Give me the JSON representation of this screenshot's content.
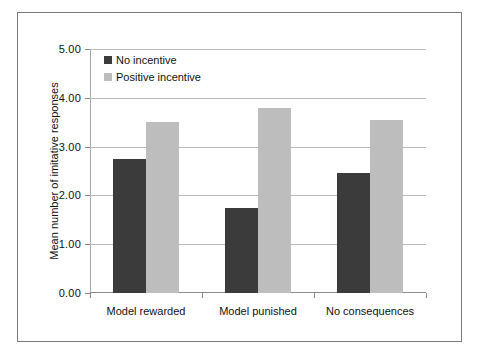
{
  "chart_data": {
    "type": "bar",
    "title": "",
    "xlabel": "",
    "ylabel": "Mean number of imitative responses",
    "categories": [
      "Model rewarded",
      "Model punished",
      "No consequences"
    ],
    "series": [
      {
        "name": "No incentive",
        "color": "#3b3b3b",
        "values": [
          2.75,
          1.75,
          2.45
        ]
      },
      {
        "name": "Positive incentive",
        "color": "#bdbdbd",
        "values": [
          3.5,
          3.8,
          3.55
        ]
      }
    ],
    "ylim": [
      0,
      5
    ],
    "ytick_step": 1,
    "ytick_labels": [
      "0.00",
      "1.00",
      "2.00",
      "3.00",
      "4.00",
      "5.00"
    ],
    "ytick_values": [
      0,
      1,
      2,
      3,
      4,
      5
    ],
    "grid": true,
    "legend_position": "top-left"
  },
  "figure": {
    "border_color": "#7a7a7a",
    "background": "#ffffff",
    "gridline_color": "#bbbbbb",
    "axis_color": "#8a8a8a"
  }
}
